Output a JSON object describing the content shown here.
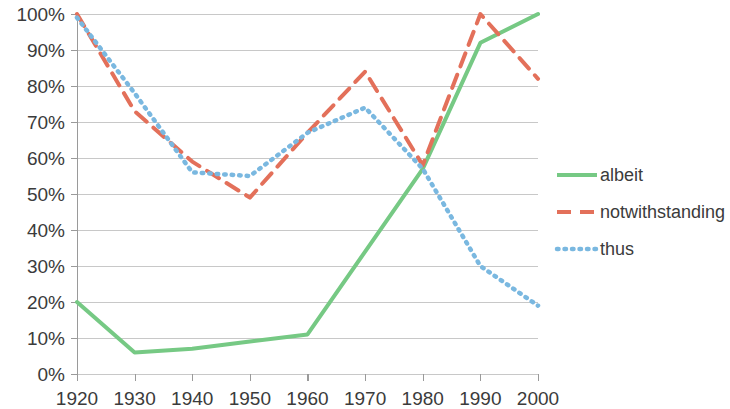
{
  "chart_data": {
    "type": "line",
    "title": "",
    "subtitle": "",
    "xlabel": "",
    "ylabel": "",
    "x": [
      1920,
      1930,
      1940,
      1950,
      1960,
      1970,
      1980,
      1990,
      2000
    ],
    "categories": [
      "1920",
      "1930",
      "1940",
      "1950",
      "1960",
      "1970",
      "1980",
      "1990",
      "2000"
    ],
    "xlim": [
      1920,
      2000
    ],
    "ylim": [
      0,
      100
    ],
    "y_tick_labels": [
      "0%",
      "10%",
      "20%",
      "30%",
      "40%",
      "50%",
      "60%",
      "70%",
      "80%",
      "90%",
      "100%"
    ],
    "y_tick_values": [
      0,
      10,
      20,
      30,
      40,
      50,
      60,
      70,
      80,
      90,
      100
    ],
    "grid": true,
    "legend_position": "right",
    "series": [
      {
        "name": "albeit",
        "color": "#76c984",
        "style": "solid",
        "values": [
          20,
          6,
          7,
          9,
          11,
          34,
          57,
          92,
          100
        ]
      },
      {
        "name": "notwithstanding",
        "color": "#e3705a",
        "style": "dashed",
        "values": [
          100,
          73,
          59,
          49,
          67,
          84,
          58,
          100,
          82
        ]
      },
      {
        "name": "thus",
        "color": "#7ab8e0",
        "style": "dotted",
        "values": [
          99,
          78,
          56,
          55,
          67,
          74,
          57,
          30,
          19
        ]
      }
    ]
  },
  "legend": {
    "items": [
      {
        "label": "albeit"
      },
      {
        "label": "notwithstanding"
      },
      {
        "label": "thus"
      }
    ]
  }
}
